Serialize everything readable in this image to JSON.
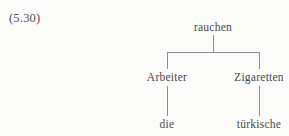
{
  "figure": {
    "example_number": "(5.30)",
    "language": "German",
    "line_color": "#8d8d8d",
    "text_color": "#4a4a4a",
    "background_color": "#fbfbfa"
  },
  "tree": {
    "root": {
      "label": "rauchen",
      "children": [
        {
          "label": "Arbeiter",
          "children": [
            {
              "label": "die",
              "children": []
            }
          ]
        },
        {
          "label": "Zigaretten",
          "children": [
            {
              "label": "türkische",
              "children": []
            }
          ]
        }
      ]
    },
    "nodes": {
      "root": "rauchen",
      "left_branch": "Arbeiter",
      "right_branch": "Zigaretten",
      "left_leaf": "die",
      "right_leaf": "türkische"
    }
  }
}
